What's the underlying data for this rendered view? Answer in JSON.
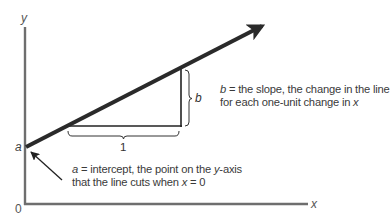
{
  "diagram": {
    "axes": {
      "y_label": "y",
      "x_label": "x",
      "origin_label": "0"
    },
    "intercept": {
      "point_label": "a",
      "annotation_var": "a",
      "annotation_line1_rest": " = intercept, the point on the ",
      "annotation_line1_var": "y",
      "annotation_line1_end": "-axis",
      "annotation_line2_pre": "that the line cuts when ",
      "annotation_line2_var": "x",
      "annotation_line2_end": " = 0"
    },
    "slope": {
      "bracket_label": "b",
      "run_label": "1",
      "annotation_var": "b",
      "annotation_line1_rest": " = the slope, the change in the line",
      "annotation_line2_pre": "for each one-unit change in ",
      "annotation_line2_var": "x"
    },
    "colors": {
      "axis": "#6e6e6e",
      "line": "#2a2a2a",
      "triangle": "#222222",
      "text": "#3a3a3a"
    }
  }
}
